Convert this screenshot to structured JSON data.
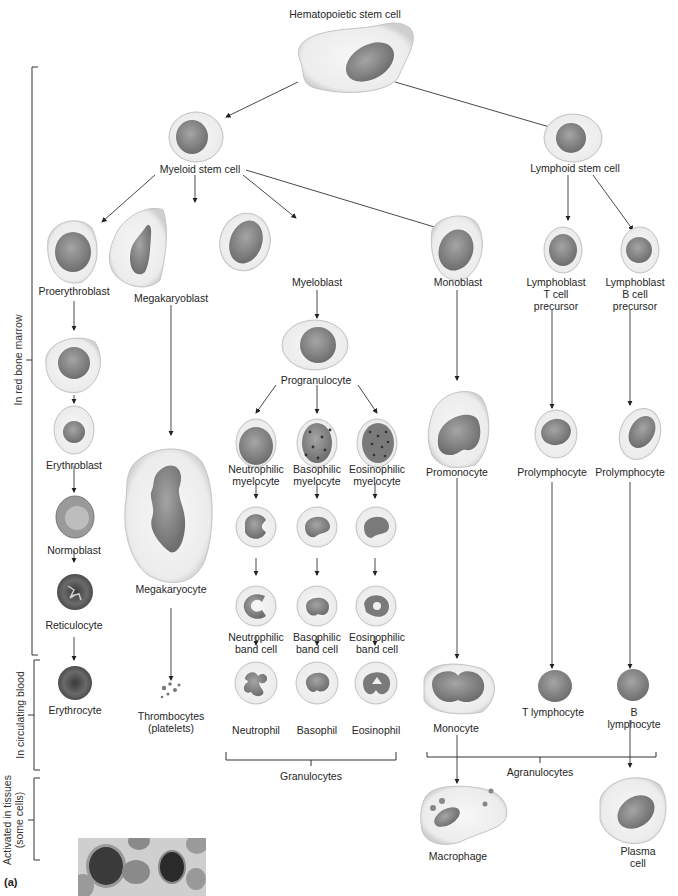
{
  "figure": {
    "panel_label": "(a)",
    "colors": {
      "cytoplasm": "#efefef",
      "cytoplasm_edge": "#c9c9c9",
      "nucleus": "#8a8a8a",
      "nucleus_dark": "#6a6a6a",
      "rbc": "#5a5a5a",
      "line": "#333333"
    },
    "side_brackets": [
      {
        "label": "In red bone marrow"
      },
      {
        "label": "In circulating blood"
      },
      {
        "label": "Activated in tissues\n(some cells)"
      }
    ],
    "nodes": {
      "hsc": "Hematopoietic stem cell",
      "myeloid_stem": "Myeloid stem cell",
      "lymphoid_stem": "Lymphoid stem cell",
      "proerythroblast": "Proerythroblast",
      "megakaryoblast": "Megakaryoblast",
      "myeloblast": "Myeloblast",
      "monoblast": "Monoblast",
      "lymphoblast_t": "Lymphoblast\nT cell\nprecursor",
      "lymphoblast_b": "Lymphoblast\nB cell\nprecursor",
      "progranulocyte": "Progranulocyte",
      "erythroblast": "Erythroblast",
      "normoblast": "Normoblast",
      "reticulocyte": "Reticulocyte",
      "erythrocyte": "Erythrocyte",
      "megakaryocyte": "Megakaryocyte",
      "thrombocytes": "Thrombocytes\n(platelets)",
      "neutrophilic_myelocyte": "Neutrophilic\nmyelocyte",
      "basophilic_myelocyte": "Basophilic\nmyelocyte",
      "eosinophilic_myelocyte": "Eosinophilic\nmyelocyte",
      "neutrophilic_band": "Neutrophilic\nband cell",
      "basophilic_band": "Basophilic\nband cell",
      "eosinophilic_band": "Eosinophilic\nband cell",
      "neutrophil": "Neutrophil",
      "basophil": "Basophil",
      "eosinophil": "Eosinophil",
      "promonocyte": "Promonocyte",
      "prolymphocyte_t": "Prolymphocyte",
      "prolymphocyte_b": "Prolymphocyte",
      "monocyte": "Monocyte",
      "t_lymphocyte": "T lymphocyte",
      "b_lymphocyte": "B lymphocyte",
      "macrophage": "Macrophage",
      "plasma_cell": "Plasma cell"
    },
    "groups": {
      "granulocytes": "Granulocytes",
      "agranulocytes": "Agranulocytes"
    }
  }
}
